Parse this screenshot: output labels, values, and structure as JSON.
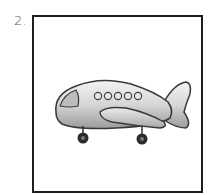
{
  "item": {
    "number": "2.",
    "image": {
      "subject": "airplane",
      "icon": "airplane-icon",
      "windows": 5,
      "wheels": 2
    }
  },
  "colors": {
    "border": "#1e1e1e",
    "body": "#d9d9d9",
    "shadow": "#9a9a9a",
    "outline": "#3a3a3a",
    "wheel": "#2b2b2b"
  }
}
